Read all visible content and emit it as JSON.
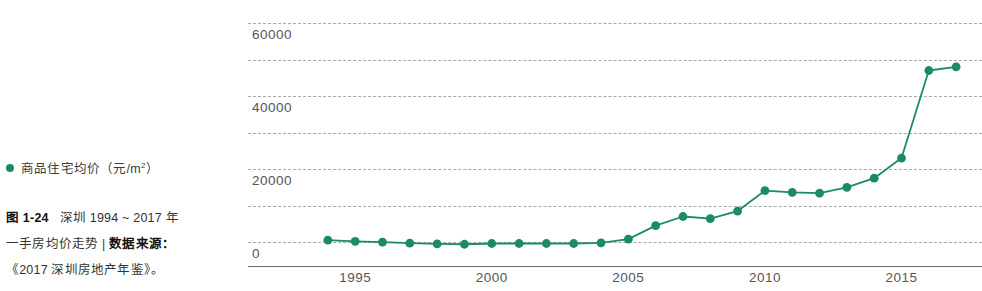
{
  "legend": {
    "marker_color": "#1b8a6b",
    "label_main": "商品住宅均价（元",
    "label_unit_pre": "/m",
    "label_unit_sup": "2",
    "label_tail": "）",
    "label_full": "商品住宅均价（元 /m2）",
    "icon": "legend-dot-icon"
  },
  "caption": {
    "fig_number": "图 1-24",
    "line1_rest": "深圳 1994 ~ 2017 年",
    "line2_part1": "一手房均价走势",
    "line2_sep": "|",
    "line2_label": "数据来源：",
    "line3": "《2017 深圳房地产年鉴》。"
  },
  "chart_data": {
    "type": "line",
    "title": "",
    "xlabel": "",
    "ylabel": "",
    "series_name": "商品住宅均价（元/m2）",
    "line_color": "#1b8a6b",
    "marker_color": "#1b8a6b",
    "grid": true,
    "legend_position": "left",
    "xlim": [
      1993.2,
      2017.8
    ],
    "ylim": [
      0,
      66000
    ],
    "xticks": [
      1995,
      2000,
      2005,
      2010,
      2015
    ],
    "xtick_labels": [
      "1995",
      "2000",
      "2005",
      "2010",
      "2015"
    ],
    "yticks": [
      0,
      20000,
      40000,
      60000
    ],
    "ytick_labels": [
      "0",
      "20000",
      "40000",
      "60000"
    ],
    "gridline_values": [
      3000,
      13000,
      23000,
      33000,
      43000,
      53000,
      63000
    ],
    "x": [
      1994,
      1995,
      1996,
      1997,
      1998,
      1999,
      2000,
      2001,
      2002,
      2003,
      2004,
      2005,
      2006,
      2007,
      2008,
      2009,
      2010,
      2011,
      2012,
      2013,
      2014,
      2015,
      2016,
      2017
    ],
    "values": [
      3500,
      3200,
      3000,
      2700,
      2500,
      2400,
      2600,
      2600,
      2600,
      2600,
      2800,
      3800,
      7500,
      10000,
      9400,
      11500,
      17100,
      16600,
      16400,
      18000,
      20500,
      26000,
      50000,
      51000
    ]
  }
}
